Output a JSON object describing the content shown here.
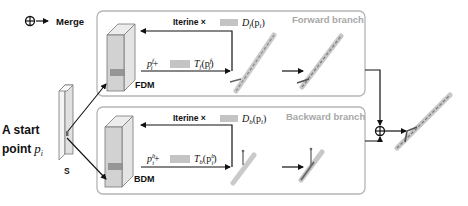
{
  "legend": {
    "symbol": "⊕",
    "arrow": "→",
    "label": "Merge"
  },
  "start_point": {
    "line1": "A start",
    "line2": "point",
    "math": "p",
    "math_sub": "i",
    "slice_label": "S"
  },
  "forward_branch": {
    "title": "Forward branch",
    "module_label": "FDM",
    "iter_label": "Iterine ×",
    "iter_math": "D",
    "iter_math_sub": "f",
    "iter_math_arg": "(p",
    "iter_math_arg_sub": "i",
    "iter_math_close": ")",
    "step_math_p": "p",
    "step_math_p_sup": "f",
    "step_math_p_sub": "i",
    "step_plus": "+",
    "step_T": "T",
    "step_T_sub": "f",
    "step_T_arg": "(p",
    "step_T_arg_sup": "f",
    "step_T_arg_sub": "i",
    "step_T_close": ")"
  },
  "backward_branch": {
    "title": "Backward branch",
    "module_label": "BDM",
    "iter_label": "Iterine ×",
    "iter_math": "D",
    "iter_math_sub": "b",
    "iter_math_arg": "(p",
    "iter_math_arg_sub": "i",
    "iter_math_close": ")",
    "step_math_p": "p",
    "step_math_p_sup": "b",
    "step_math_p_sub": "i",
    "step_plus": "+",
    "step_T": "T",
    "step_T_sub": "b",
    "step_T_arg": "(p",
    "step_T_arg_sup": "b",
    "step_T_arg_sub": "i",
    "step_T_close": ")"
  },
  "merge_symbol": "⊕",
  "colors": {
    "box_border": "#b5b5b5",
    "arrow": "#111111",
    "block_face": "#d6d6d6",
    "block_side": "#e8e8e8",
    "highlight": "#8c8c8c",
    "vessel": "#9a9a9a"
  }
}
